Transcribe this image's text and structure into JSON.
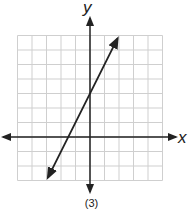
{
  "chart_data": {
    "type": "line",
    "title": "",
    "caption": "(3)",
    "xlabel": "x",
    "ylabel": "y",
    "grid": true,
    "xlim": [
      -5,
      5
    ],
    "ylim": [
      -3,
      7
    ],
    "x_tick_labels": [],
    "y_tick_labels": [],
    "series": [
      {
        "name": "line",
        "equation": "y = 2x + 3",
        "slope": 2,
        "y_intercept": 3,
        "x_intercept": -1.5,
        "x": [
          -2.9,
          1.9
        ],
        "y": [
          -2.8,
          6.8
        ],
        "arrows_both_ends": true
      }
    ]
  },
  "labels": {
    "x_axis": "x",
    "y_axis": "y",
    "caption": "(3)"
  },
  "colors": {
    "grid": "#cfcfcf",
    "axis": "#222222",
    "line": "#222222"
  }
}
